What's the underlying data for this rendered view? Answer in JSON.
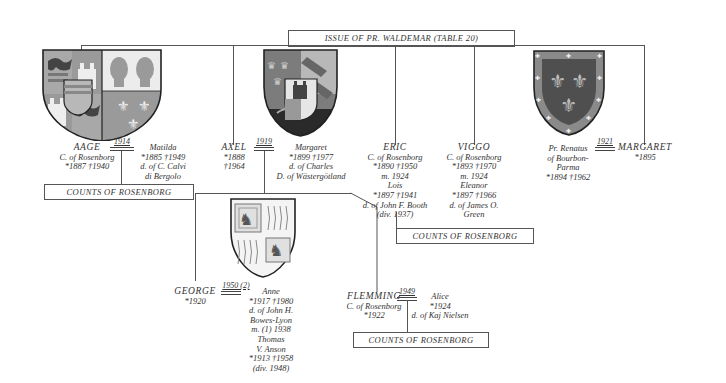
{
  "title": "ISSUE OF PR. WALDEMAR (TABLE 20)",
  "colors": {
    "line": "#555555",
    "shield_gray": "#8f8f8f",
    "shield_dark": "#5a5a5a",
    "shield_light": "#c9c9c9",
    "border": "#2a2a2a"
  },
  "children": [
    {
      "name": "AAGE",
      "lines": [
        "C. of Rosenborg",
        "*1887   †1940"
      ],
      "marriage_year": "1914",
      "spouse": {
        "name": "Matilda",
        "lines": [
          "*1885   †1949",
          "d. of C. Calvi",
          "di Bergolo"
        ]
      },
      "issue_box": "COUNTS OF ROSENBORG",
      "arms": "shield-aage-matilda-icon"
    },
    {
      "name": "AXEL",
      "lines": [
        "*1888",
        "†1964"
      ],
      "marriage_year": "1919",
      "spouse": {
        "name": "Margaret",
        "lines": [
          "*1899   †1977",
          "d. of Charles",
          "D. of Wästergötland"
        ]
      },
      "arms": "shield-axel-icon"
    },
    {
      "name": "ERIC",
      "lines": [
        "C. of Rosenborg",
        "*1890   †1950",
        "m. 1924",
        "Lois",
        "*1897   †1941",
        "d. of John F. Booth",
        "(div. 1937)"
      ]
    },
    {
      "name": "VIGGO",
      "lines": [
        "C. of Rosenborg",
        "*1893   †1970",
        "m. 1924",
        "Eleanor",
        "*1897   †1966",
        "d. of James O.",
        "Green"
      ],
      "issue_box": "COUNTS OF ROSENBORG"
    },
    {
      "name": "MARGARET",
      "lines": [
        "*1895"
      ],
      "marriage_year": "1921",
      "spouse": {
        "name": "Pr. Renatus",
        "lines": [
          "of Bourbon-",
          "Parma",
          "*1894   †1962"
        ]
      },
      "arms": "shield-bourbon-parma-icon"
    }
  ],
  "grandchildren": [
    {
      "name": "GEORGE",
      "lines": [
        "*1920"
      ],
      "marriage_year": "1950 (2)",
      "spouse": {
        "name": "Anne",
        "lines": [
          "*1917   †1980",
          "d. of John H.",
          "Bowes-Lyon",
          "m. (1) 1938",
          "Thomas",
          "V. Anson",
          "*1913   †1958",
          "(div. 1948)"
        ]
      },
      "arms": "shield-george-icon"
    },
    {
      "name": "FLEMMING",
      "lines": [
        "C. of Rosenborg",
        "*1922"
      ],
      "marriage_year": "1949",
      "spouse": {
        "name": "Alice",
        "lines": [
          "*1924",
          "d. of Kaj Nielsen"
        ]
      },
      "issue_box": "COUNTS OF ROSENBORG"
    }
  ]
}
